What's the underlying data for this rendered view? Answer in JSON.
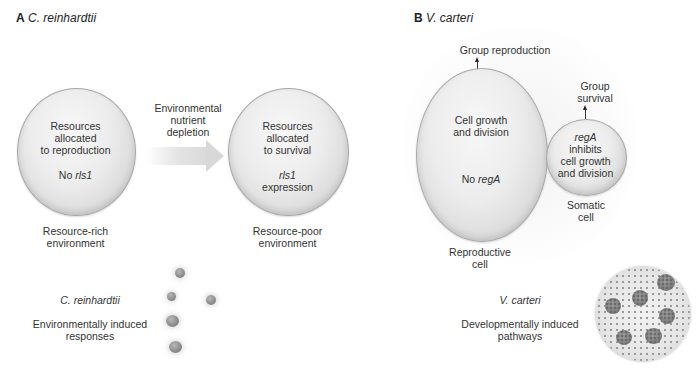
{
  "panel_a": {
    "letter": "A",
    "species": "C. reinhardtii",
    "left_cell": {
      "line1": "Resources",
      "line2": "allocated",
      "line3": "to reproduction",
      "gene_prefix": "No ",
      "gene": "rls1"
    },
    "left_caption": {
      "line1": "Resource-rich",
      "line2": "environment"
    },
    "arrow_label": {
      "line1": "Environmental",
      "line2": "nutrient",
      "line3": "depletion"
    },
    "right_cell": {
      "line1": "Resources",
      "line2": "allocated",
      "line3": "to survival",
      "gene": "rls1",
      "gene_suffix": "expression"
    },
    "right_caption": {
      "line1": "Resource-poor",
      "line2": "environment"
    },
    "organism_label": "C. reinhardtii",
    "response_label": {
      "line1": "Environmentally induced",
      "line2": "responses"
    }
  },
  "panel_b": {
    "letter": "B",
    "species": "V. carteri",
    "group_reproduction": "Group reproduction",
    "reproductive_cell": {
      "line1": "Cell growth",
      "line2": "and division",
      "gene_prefix": "No ",
      "gene": "regA"
    },
    "reproductive_caption": {
      "line1": "Reproductive",
      "line2": "cell"
    },
    "group_survival": {
      "line1": "Group",
      "line2": "survival"
    },
    "somatic_cell": {
      "gene": "regA",
      "line1": "inhibits",
      "line2": "cell growth",
      "line3": "and division"
    },
    "somatic_caption": {
      "line1": "Somatic",
      "line2": "cell"
    },
    "organism_label": "V. carteri",
    "pathway_label": {
      "line1": "Developmentally induced",
      "line2": "pathways"
    }
  },
  "colors": {
    "cell_fill": "#ececec",
    "cell_edge": "#a8a8a8",
    "text": "#333333",
    "arrow": "#d8d8d8"
  }
}
